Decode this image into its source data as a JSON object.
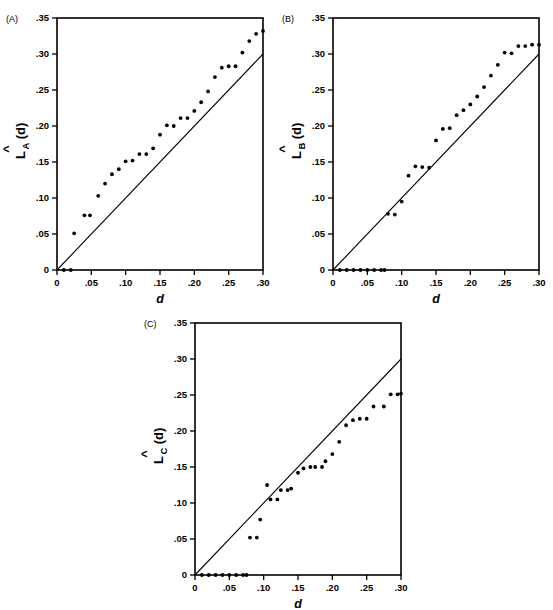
{
  "figure": {
    "background": "#ffffff",
    "ink_color": "#000000",
    "panel_count": 3
  },
  "chart_data": [
    {
      "id": "A",
      "type": "scatter",
      "panel_label": "(A)",
      "title": "",
      "xlabel": "d",
      "ylabel": "L̂_A(d)",
      "ylabel_parts": {
        "hat": "^",
        "main": "L",
        "sub": "A",
        "tail": "(d)"
      },
      "xlim": [
        0,
        0.3
      ],
      "ylim": [
        0,
        0.35
      ],
      "xticks": [
        0,
        0.05,
        0.1,
        0.15,
        0.2,
        0.25,
        0.3
      ],
      "xticklabels": [
        "0",
        ".05",
        ".10",
        ".15",
        ".20",
        ".25",
        ".30"
      ],
      "yticks": [
        0,
        0.05,
        0.1,
        0.15,
        0.2,
        0.25,
        0.3,
        0.35
      ],
      "yticklabels": [
        "0",
        ".05",
        ".10",
        ".15",
        ".20",
        ".25",
        ".30",
        ".35"
      ],
      "grid": false,
      "legend": "none",
      "reference_line": {
        "name": "theoretical L(d)=d",
        "x": [
          0,
          0.3
        ],
        "y": [
          0,
          0.3
        ],
        "style": "solid"
      },
      "series": [
        {
          "name": "L-hat A",
          "marker": "filled-circle",
          "x": [
            0.01,
            0.02,
            0.025,
            0.04,
            0.048,
            0.06,
            0.07,
            0.08,
            0.09,
            0.1,
            0.11,
            0.12,
            0.13,
            0.14,
            0.15,
            0.16,
            0.17,
            0.18,
            0.19,
            0.2,
            0.21,
            0.22,
            0.23,
            0.24,
            0.25,
            0.26,
            0.27,
            0.28,
            0.29,
            0.3
          ],
          "y": [
            0.0,
            0.0,
            0.051,
            0.076,
            0.076,
            0.103,
            0.12,
            0.133,
            0.14,
            0.151,
            0.152,
            0.161,
            0.161,
            0.169,
            0.188,
            0.201,
            0.2,
            0.211,
            0.211,
            0.221,
            0.233,
            0.248,
            0.268,
            0.281,
            0.283,
            0.283,
            0.302,
            0.318,
            0.328,
            0.332
          ]
        }
      ]
    },
    {
      "id": "B",
      "type": "scatter",
      "panel_label": "(B)",
      "title": "",
      "xlabel": "d",
      "ylabel": "L̂_B(d)",
      "ylabel_parts": {
        "hat": "^",
        "main": "L",
        "sub": "B",
        "tail": "(d)"
      },
      "xlim": [
        0,
        0.3
      ],
      "ylim": [
        0,
        0.35
      ],
      "xticks": [
        0,
        0.05,
        0.1,
        0.15,
        0.2,
        0.25,
        0.3
      ],
      "xticklabels": [
        "0",
        ".05",
        ".10",
        ".15",
        ".20",
        ".25",
        ".30"
      ],
      "yticks": [
        0,
        0.05,
        0.1,
        0.15,
        0.2,
        0.25,
        0.3,
        0.35
      ],
      "yticklabels": [
        "0",
        ".05",
        ".10",
        ".15",
        ".20",
        ".25",
        ".30",
        ".35"
      ],
      "grid": false,
      "legend": "none",
      "reference_line": {
        "name": "theoretical L(d)=d",
        "x": [
          0,
          0.3
        ],
        "y": [
          0,
          0.3
        ],
        "style": "solid"
      },
      "series": [
        {
          "name": "L-hat B",
          "marker": "filled-circle",
          "x": [
            0.01,
            0.02,
            0.03,
            0.04,
            0.05,
            0.06,
            0.07,
            0.075,
            0.08,
            0.09,
            0.1,
            0.11,
            0.12,
            0.13,
            0.14,
            0.15,
            0.16,
            0.17,
            0.18,
            0.19,
            0.2,
            0.21,
            0.22,
            0.23,
            0.24,
            0.25,
            0.26,
            0.27,
            0.28,
            0.29,
            0.3
          ],
          "y": [
            0.0,
            0.0,
            0.0,
            0.0,
            0.0,
            0.0,
            0.0,
            0.0,
            0.078,
            0.077,
            0.095,
            0.131,
            0.144,
            0.143,
            0.142,
            0.18,
            0.196,
            0.197,
            0.215,
            0.222,
            0.23,
            0.241,
            0.254,
            0.27,
            0.285,
            0.302,
            0.301,
            0.311,
            0.311,
            0.313,
            0.313
          ]
        }
      ]
    },
    {
      "id": "C",
      "type": "scatter",
      "panel_label": "(C)",
      "title": "",
      "xlabel": "d",
      "ylabel": "L̂_C(d)",
      "ylabel_parts": {
        "hat": "^",
        "main": "L",
        "sub": "C",
        "tail": "(d)"
      },
      "xlim": [
        0,
        0.3
      ],
      "ylim": [
        0,
        0.35
      ],
      "xticks": [
        0,
        0.05,
        0.1,
        0.15,
        0.2,
        0.25,
        0.3
      ],
      "xticklabels": [
        "0",
        ".05",
        ".10",
        ".15",
        ".20",
        ".25",
        ".30"
      ],
      "yticks": [
        0,
        0.05,
        0.1,
        0.15,
        0.2,
        0.25,
        0.3,
        0.35
      ],
      "yticklabels": [
        "0",
        ".05",
        ".10",
        ".15",
        ".20",
        ".25",
        ".30",
        ".35"
      ],
      "grid": false,
      "legend": "none",
      "reference_line": {
        "name": "theoretical L(d)=d",
        "x": [
          0,
          0.3
        ],
        "y": [
          0,
          0.3
        ],
        "style": "solid"
      },
      "series": [
        {
          "name": "L-hat C",
          "marker": "filled-circle",
          "x": [
            0.01,
            0.02,
            0.03,
            0.04,
            0.05,
            0.06,
            0.07,
            0.075,
            0.08,
            0.09,
            0.095,
            0.105,
            0.11,
            0.12,
            0.125,
            0.135,
            0.14,
            0.15,
            0.158,
            0.168,
            0.175,
            0.185,
            0.19,
            0.2,
            0.21,
            0.22,
            0.23,
            0.24,
            0.25,
            0.26,
            0.275,
            0.285,
            0.295,
            0.3
          ],
          "y": [
            0.0,
            0.0,
            0.0,
            0.0,
            0.0,
            0.0,
            0.0,
            0.0,
            0.052,
            0.052,
            0.077,
            0.125,
            0.105,
            0.105,
            0.118,
            0.118,
            0.12,
            0.142,
            0.148,
            0.15,
            0.15,
            0.15,
            0.158,
            0.168,
            0.185,
            0.208,
            0.215,
            0.217,
            0.217,
            0.234,
            0.234,
            0.251,
            0.251,
            0.252
          ]
        }
      ]
    }
  ]
}
